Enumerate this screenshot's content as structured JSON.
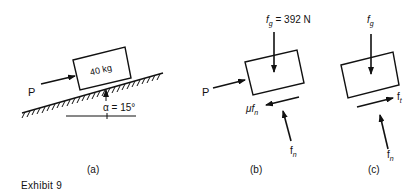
{
  "exhibit": {
    "title": "Exhibit 9"
  },
  "panels": [
    {
      "id": "a",
      "caption": "(a)",
      "block_label": "40 kg",
      "applied_force_label": "P",
      "angle_label": "α = 15°"
    },
    {
      "id": "b",
      "caption": "(b)",
      "weight_label_main": "f",
      "weight_label_sub": "g",
      "weight_label_value": " = 392 N",
      "applied_force_label": "P",
      "friction_label_main": "μf",
      "friction_label_sub": "n",
      "normal_label_main": "f",
      "normal_label_sub": "n"
    },
    {
      "id": "c",
      "caption": "(c)",
      "weight_label_main": "f",
      "weight_label_sub": "g",
      "friction_label_main": "f",
      "friction_label_sub": "t",
      "normal_label_main": "f",
      "normal_label_sub": "n"
    }
  ],
  "colors": {
    "ink": "#111111",
    "background": "#ffffff"
  }
}
